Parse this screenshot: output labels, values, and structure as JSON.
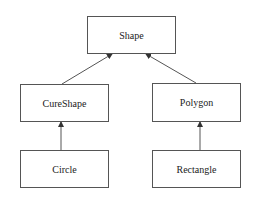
{
  "diagram": {
    "type": "class-hierarchy",
    "nodes": [
      {
        "id": "shape",
        "label": "Shape"
      },
      {
        "id": "cureshape",
        "label": "CureShape"
      },
      {
        "id": "polygon",
        "label": "Polygon"
      },
      {
        "id": "circle",
        "label": "Circle"
      },
      {
        "id": "rectangle",
        "label": "Rectangle"
      }
    ],
    "edges": [
      {
        "from": "CureShape",
        "to": "Shape"
      },
      {
        "from": "Polygon",
        "to": "Shape"
      },
      {
        "from": "Circle",
        "to": "CureShape"
      },
      {
        "from": "Rectangle",
        "to": "Polygon"
      }
    ],
    "colors": {
      "stroke": "#555555",
      "text": "#222222",
      "background": "#ffffff"
    }
  }
}
